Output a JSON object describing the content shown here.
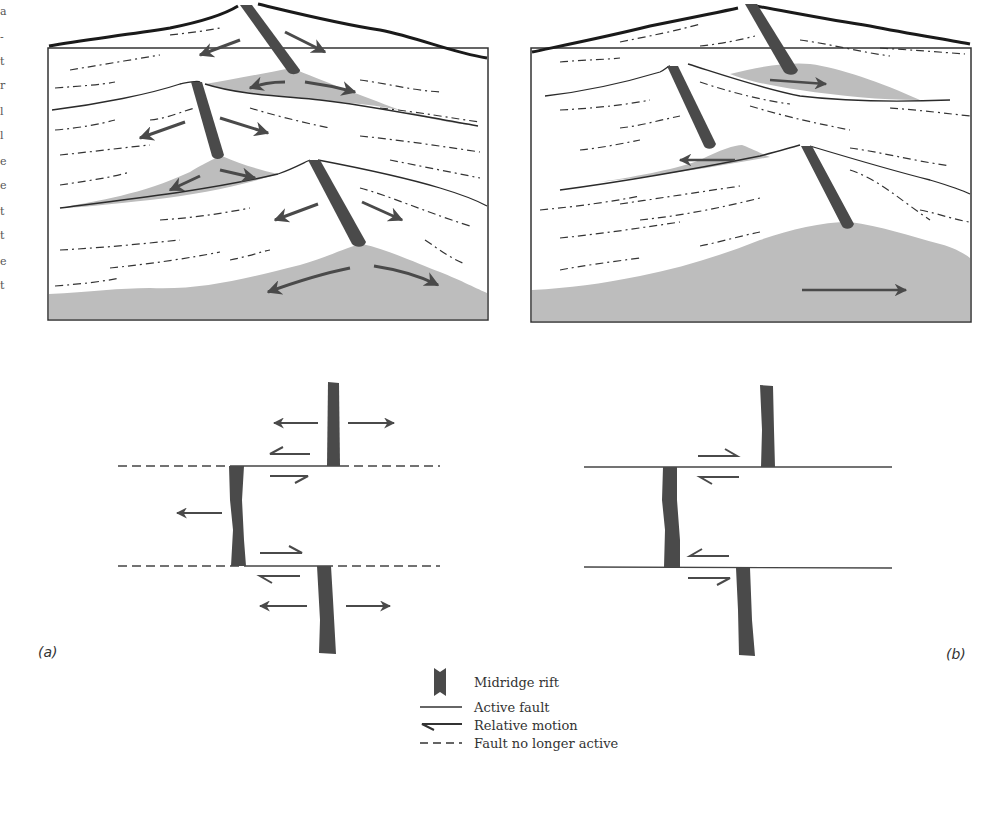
{
  "figure": {
    "panel_a_label": "(a)",
    "panel_b_label": "(b)",
    "clipped_margin_chars": [
      "a",
      "-",
      "t",
      "r",
      "l",
      "l",
      "e",
      "e",
      "t",
      "t",
      "e",
      "t"
    ]
  },
  "legend": {
    "items": [
      {
        "symbol": "rift-bar",
        "label": "Midridge rift"
      },
      {
        "symbol": "solid-line",
        "label": "Active fault"
      },
      {
        "symbol": "half-arrow",
        "label": "Relative motion"
      },
      {
        "symbol": "dashed-line",
        "label": "Fault no longer active"
      }
    ]
  },
  "colors": {
    "rift": "#4a4a4a",
    "fill_gray": "#bdbdbd",
    "line": "#2b2b2b",
    "arrow": "#4a4a4a",
    "background": "#ffffff"
  }
}
